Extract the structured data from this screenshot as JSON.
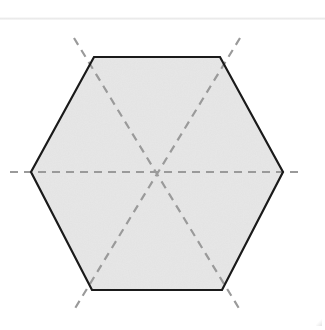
{
  "figure": {
    "title": "Regular hexagon with lines of symmetry",
    "shape_name": "regular-hexagon",
    "background_color": "#ffffff",
    "fill_color": "#e3e3e3",
    "outline_color": "#1a1a1a",
    "outline_width": 2.2,
    "symmetry_line_color": "#9a9a9a",
    "symmetry_line_width": 2.2,
    "dash_pattern": "8 6",
    "scan_line_color": "#e9e9e9",
    "center": {
      "x": 157,
      "y": 172
    },
    "vertices": [
      {
        "name": "top-left",
        "x": 94,
        "y": 57
      },
      {
        "name": "top-right",
        "x": 220,
        "y": 57
      },
      {
        "name": "right",
        "x": 283,
        "y": 172
      },
      {
        "name": "bottom-right",
        "x": 222,
        "y": 290
      },
      {
        "name": "bottom-left",
        "x": 92,
        "y": 290
      },
      {
        "name": "left",
        "x": 31,
        "y": 172
      }
    ],
    "symmetry_lines": [
      {
        "name": "horizontal-axis",
        "x1": 10,
        "y1": 172,
        "x2": 303,
        "y2": 172
      },
      {
        "name": "diagonal-axis-left",
        "x1": 74,
        "y1": 38,
        "x2": 240,
        "y2": 310
      },
      {
        "name": "diagonal-axis-right",
        "x1": 240,
        "y1": 38,
        "x2": 74,
        "y2": 310
      }
    ],
    "symmetry_line_count": 3,
    "side_count": 6,
    "vertex_count": 6
  }
}
